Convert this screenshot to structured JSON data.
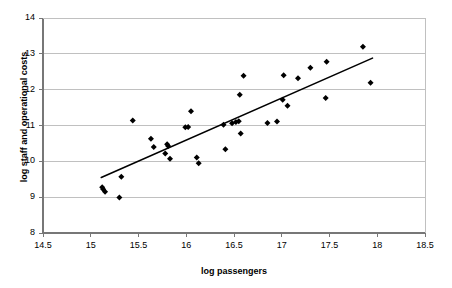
{
  "chart_data": {
    "type": "scatter",
    "title": "",
    "xlabel": "log passengers",
    "ylabel": "log staff and operational costs",
    "xlim": [
      14.5,
      18.5
    ],
    "ylim": [
      8,
      14
    ],
    "xticks": [
      "14.5",
      "15",
      "15.5",
      "16",
      "16.5",
      "17",
      "17.5",
      "18",
      "18.5"
    ],
    "xtick_values": [
      14.5,
      15,
      15.5,
      16,
      16.5,
      17,
      17.5,
      18,
      18.5
    ],
    "yticks": [
      "8",
      "9",
      "10",
      "11",
      "12",
      "13",
      "14"
    ],
    "ytick_values": [
      8,
      9,
      10,
      11,
      12,
      13,
      14
    ],
    "grid": "horizontal",
    "grid_color": "#c0c0c0",
    "axis_color": "#808080",
    "marker_color": "#000000",
    "marker_shape": "diamond",
    "marker_size": 3,
    "legend": "none",
    "points": [
      [
        15.12,
        9.28
      ],
      [
        15.13,
        9.22
      ],
      [
        15.15,
        9.15
      ],
      [
        15.3,
        8.99
      ],
      [
        15.32,
        9.57
      ],
      [
        15.44,
        11.14
      ],
      [
        15.63,
        10.63
      ],
      [
        15.66,
        10.4
      ],
      [
        15.78,
        10.22
      ],
      [
        15.8,
        10.48
      ],
      [
        15.81,
        10.43
      ],
      [
        15.83,
        10.07
      ],
      [
        15.99,
        10.95
      ],
      [
        16.02,
        10.96
      ],
      [
        16.05,
        11.4
      ],
      [
        16.11,
        10.11
      ],
      [
        16.13,
        9.95
      ],
      [
        16.39,
        11.02
      ],
      [
        16.41,
        10.34
      ],
      [
        16.48,
        11.06
      ],
      [
        16.52,
        11.1
      ],
      [
        16.55,
        11.12
      ],
      [
        16.56,
        11.86
      ],
      [
        16.57,
        10.78
      ],
      [
        16.6,
        12.39
      ],
      [
        16.85,
        11.07
      ],
      [
        16.95,
        11.11
      ],
      [
        17.01,
        11.72
      ],
      [
        17.02,
        12.4
      ],
      [
        17.06,
        11.55
      ],
      [
        17.17,
        12.32
      ],
      [
        17.3,
        12.61
      ],
      [
        17.46,
        11.77
      ],
      [
        17.47,
        12.78
      ],
      [
        17.85,
        13.2
      ],
      [
        17.93,
        12.19
      ]
    ],
    "trendline": {
      "type": "linear",
      "x_start": 15.11,
      "y_start": 9.55,
      "x_end": 17.95,
      "y_end": 12.88,
      "color": "#000000",
      "width": 1.6
    }
  }
}
